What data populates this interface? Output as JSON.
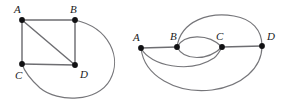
{
  "figure": {
    "background_color": "#ffffff",
    "edge_color": "#6e6e72",
    "vertex_color": "#111113",
    "label_color": "#1a1a1c",
    "graphs": [
      {
        "id": "left-graph",
        "name": "square-with-diagonal-and-outer-arc",
        "vertices": [
          {
            "label": "A",
            "x": 22,
            "y": 20,
            "label_x": 14,
            "label_y": 10
          },
          {
            "label": "B",
            "x": 75,
            "y": 20,
            "label_x": 70,
            "label_y": 10
          },
          {
            "label": "C",
            "x": 22,
            "y": 64,
            "label_x": 15,
            "label_y": 76
          },
          {
            "label": "D",
            "x": 75,
            "y": 65,
            "label_x": 80,
            "label_y": 75
          }
        ],
        "edges": [
          {
            "from": "A",
            "to": "B",
            "kind": "straight"
          },
          {
            "from": "A",
            "to": "C",
            "kind": "straight"
          },
          {
            "from": "B",
            "to": "D",
            "kind": "straight"
          },
          {
            "from": "C",
            "to": "D",
            "kind": "straight"
          },
          {
            "from": "A",
            "to": "D",
            "kind": "diagonal"
          },
          {
            "from": "B",
            "to": "C",
            "kind": "outer-arc"
          }
        ]
      },
      {
        "id": "right-graph",
        "name": "collinear-multigraph-with-arcs",
        "vertices": [
          {
            "label": "A",
            "x": 141,
            "y": 48,
            "label_x": 133,
            "label_y": 38
          },
          {
            "label": "B",
            "x": 177,
            "y": 47,
            "label_x": 170,
            "label_y": 37
          },
          {
            "label": "C",
            "x": 222,
            "y": 47,
            "label_x": 216,
            "label_y": 37
          },
          {
            "label": "D",
            "x": 262,
            "y": 46,
            "label_x": 267,
            "label_y": 37
          }
        ],
        "edges": [
          {
            "from": "A",
            "to": "B",
            "kind": "straight"
          },
          {
            "from": "C",
            "to": "D",
            "kind": "straight"
          },
          {
            "from": "B",
            "to": "C",
            "kind": "arc-above"
          },
          {
            "from": "B",
            "to": "C",
            "kind": "arc-below"
          },
          {
            "from": "B",
            "to": "D",
            "kind": "arc-above-tall"
          },
          {
            "from": "A",
            "to": "C",
            "kind": "arc-below"
          },
          {
            "from": "A",
            "to": "D",
            "kind": "arc-below-deep"
          }
        ]
      }
    ]
  }
}
